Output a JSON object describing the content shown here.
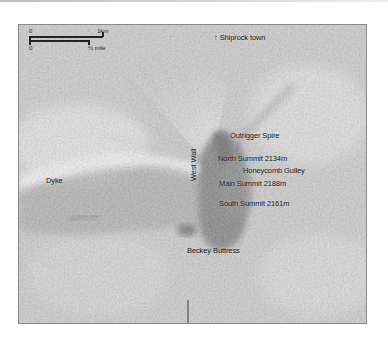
{
  "map": {
    "title_hint": "Aerial view of Shiprock",
    "scale": {
      "km_start": "0",
      "km_end": "1km",
      "mile_start": "0",
      "mile_end": "½ mile"
    },
    "north_label": "↑ Shiprock town",
    "labels": {
      "outrigger_spire": "Outrigger Spire",
      "north_summit": "North Summit 2134m",
      "honeycomb_gulley": "Honeycomb Gulley",
      "main_summit": "Main Summit 2188m",
      "south_summit": "South Summit 2161m",
      "beckey_buttress": "Beckey Buttress",
      "west_wall": "West Wall",
      "dyke": "Dyke"
    }
  }
}
